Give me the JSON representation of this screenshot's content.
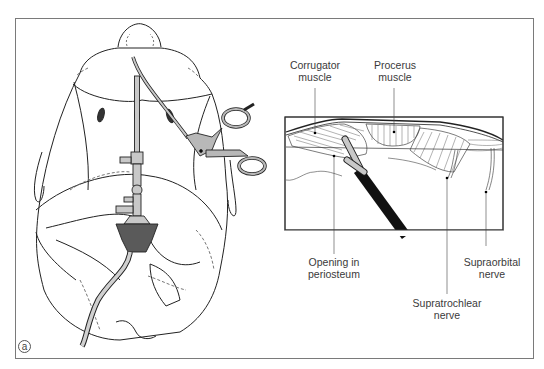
{
  "figure": {
    "panel_label": "a",
    "left_panel": {
      "subject": "top-down view of patient head with endoscope and forceps inserted through scalp incisions"
    },
    "inset": {
      "labels": {
        "corrugator": [
          "Corrugator",
          "muscle"
        ],
        "procerus": [
          "Procerus",
          "muscle"
        ],
        "periosteum": [
          "Opening in",
          "periosteum"
        ],
        "supratrochlear": [
          "Supratrochlear",
          "nerve"
        ],
        "supraorbital": [
          "Supraorbital",
          "nerve"
        ]
      }
    },
    "colors": {
      "line": "#222222",
      "frame": "#7a7a7a",
      "instrument_fill": "#b8b8b8",
      "dark_fill": "#5a5a5a",
      "scope_black": "#111111"
    }
  }
}
